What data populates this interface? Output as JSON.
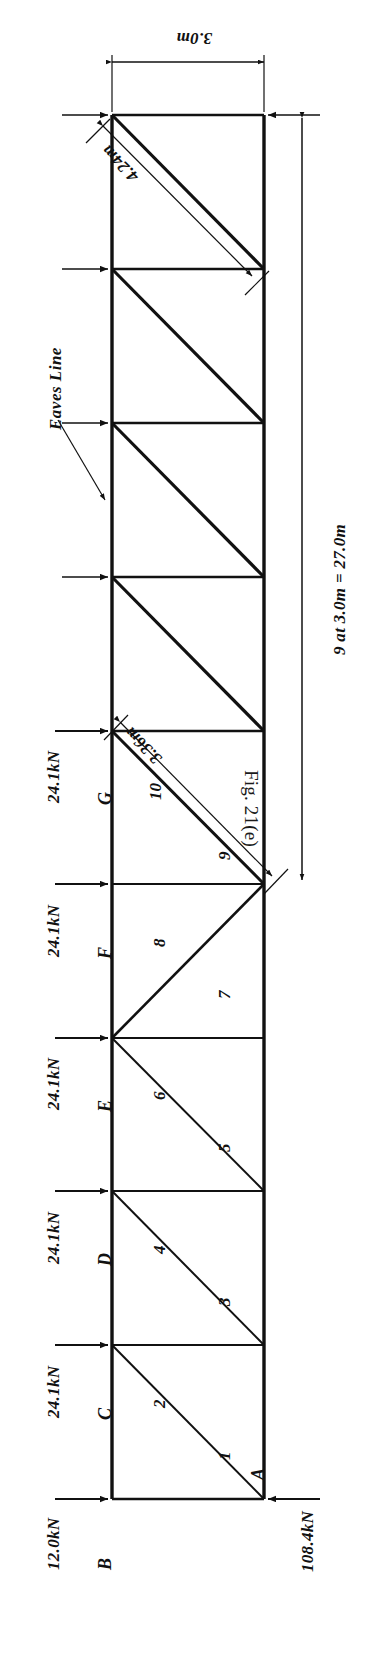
{
  "figure": {
    "caption": "Fig. 21(e)"
  },
  "dimensions": {
    "panel_width": "3.0m",
    "diagonal_upper": "4.24m",
    "diagonal_apex": "3.36m",
    "overall_span": "9 at 3.0m = 27.0m"
  },
  "annotations": {
    "eaves_line": "Eaves Line"
  },
  "loads": [
    {
      "label": "12.0kN",
      "node": "B"
    },
    {
      "label": "24.1kN",
      "node": "C"
    },
    {
      "label": "24.1kN",
      "node": "D"
    },
    {
      "label": "24.1kN",
      "node": "E"
    },
    {
      "label": "24.1kN",
      "node": "F"
    },
    {
      "label": "24.1kN",
      "node": "G"
    }
  ],
  "reaction": {
    "label": "108.4kN",
    "node": "A"
  },
  "nodes": [
    {
      "label": "A"
    },
    {
      "label": "B"
    },
    {
      "label": "C"
    },
    {
      "label": "D"
    },
    {
      "label": "E"
    },
    {
      "label": "F"
    },
    {
      "label": "G"
    }
  ],
  "members": [
    {
      "label": "1"
    },
    {
      "label": "2"
    },
    {
      "label": "3"
    },
    {
      "label": "4"
    },
    {
      "label": "5"
    },
    {
      "label": "6"
    },
    {
      "label": "7"
    },
    {
      "label": "8"
    },
    {
      "label": "9"
    },
    {
      "label": "10"
    }
  ],
  "colors": {
    "ink": "#111111",
    "paper": "#ffffff"
  }
}
